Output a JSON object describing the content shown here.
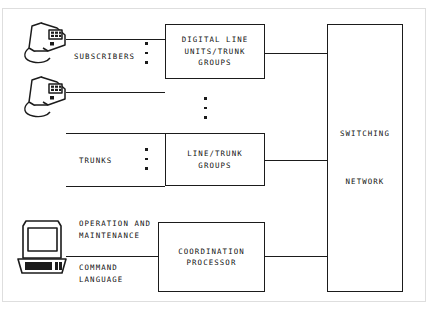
{
  "diagram": {
    "boxes": {
      "digital_line_units": "DIGITAL LINE\nUNITS/TRUNK\nGROUPS",
      "line_trunk_groups": "LINE/TRUNK GROUPS",
      "coordination_processor": "COORDINATION\nPROCESSOR",
      "switching_network": "SWITCHING\n\nNETWORK"
    },
    "labels": {
      "subscribers": "SUBSCRIBERS",
      "trunks": "TRUNKS",
      "operation_and_maintenance": "OPERATION AND\nMAINTENANCE",
      "command_language": "COMMAND\nLANGUAGE"
    },
    "icons": {
      "subscriber_phone_top": "telephone-icon",
      "subscriber_phone_bottom": "telephone-icon",
      "terminal": "computer-terminal-icon"
    },
    "ellipsis_groups": [
      {
        "name": "subscribers-ellipsis",
        "dots": 3
      },
      {
        "name": "digital-line-to-line-trunk-ellipsis",
        "dots": 3
      },
      {
        "name": "trunks-ellipsis",
        "dots": 3
      }
    ],
    "colors": {
      "stroke": "#1b1b1b",
      "background": "#ffffff",
      "frame": "#dedede"
    }
  }
}
